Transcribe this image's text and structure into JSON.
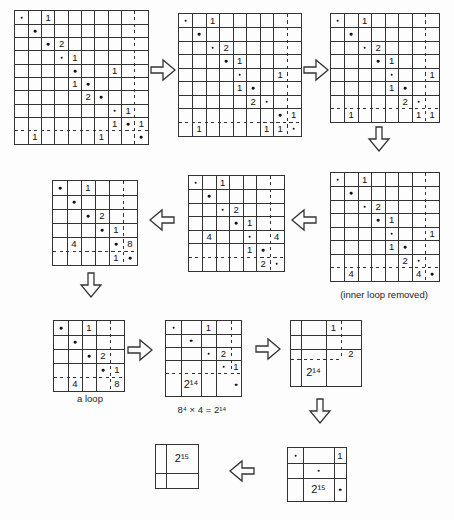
{
  "figure": {
    "bg_color": "#fdfdfd",
    "line_color": "#333333",
    "text_color": "#111111",
    "labels": {
      "inner_loop_removed": "(inner loop removed)",
      "a_loop": "a loop",
      "equation": "8⁴ × 4 = 2¹⁴"
    },
    "grids": [
      {
        "id": "step1-10x10",
        "x": 14,
        "y": 10,
        "ncols": 10,
        "nrows": 10,
        "cell": 13.3,
        "dash_after_col": 9,
        "dash_after_row": 9,
        "dash_v_span": "full",
        "dash_h_span": "full",
        "entries": [
          {
            "r": 1,
            "c": 1,
            "t": "dot"
          },
          {
            "r": 1,
            "c": 3,
            "t": "1"
          },
          {
            "r": 2,
            "c": 2,
            "t": "dot"
          },
          {
            "r": 3,
            "c": 3,
            "t": "dot"
          },
          {
            "r": 3,
            "c": 4,
            "t": "2"
          },
          {
            "r": 4,
            "c": 4,
            "t": "dot"
          },
          {
            "r": 4,
            "c": 5,
            "t": "1"
          },
          {
            "r": 5,
            "c": 5,
            "t": "dot"
          },
          {
            "r": 5,
            "c": 8,
            "t": "1"
          },
          {
            "r": 6,
            "c": 5,
            "t": "1"
          },
          {
            "r": 6,
            "c": 6,
            "t": "dot"
          },
          {
            "r": 7,
            "c": 6,
            "t": "2"
          },
          {
            "r": 7,
            "c": 7,
            "t": "dot"
          },
          {
            "r": 8,
            "c": 8,
            "t": "dot"
          },
          {
            "r": 8,
            "c": 9,
            "t": "1"
          },
          {
            "r": 9,
            "c": 8,
            "t": "1"
          },
          {
            "r": 9,
            "c": 9,
            "t": "dot"
          },
          {
            "r": 9,
            "c": 10,
            "t": "1"
          },
          {
            "r": 10,
            "c": 2,
            "t": "1"
          },
          {
            "r": 10,
            "c": 7,
            "t": "1"
          },
          {
            "r": 10,
            "c": 10,
            "t": "dot"
          }
        ]
      },
      {
        "id": "step2-9x9",
        "x": 178,
        "y": 13,
        "ncols": 9,
        "nrows": 9,
        "cell": 13.5,
        "dash_after_col": 8,
        "dash_after_row": 8,
        "dash_v_span": "full",
        "dash_h_span": "full",
        "entries": [
          {
            "r": 1,
            "c": 1,
            "t": "dot"
          },
          {
            "r": 1,
            "c": 3,
            "t": "1"
          },
          {
            "r": 2,
            "c": 2,
            "t": "dot"
          },
          {
            "r": 3,
            "c": 3,
            "t": "dot"
          },
          {
            "r": 3,
            "c": 4,
            "t": "2"
          },
          {
            "r": 4,
            "c": 4,
            "t": "dot"
          },
          {
            "r": 4,
            "c": 5,
            "t": "1"
          },
          {
            "r": 5,
            "c": 5,
            "t": "dot"
          },
          {
            "r": 5,
            "c": 8,
            "t": "1"
          },
          {
            "r": 6,
            "c": 5,
            "t": "1"
          },
          {
            "r": 6,
            "c": 6,
            "t": "dot"
          },
          {
            "r": 7,
            "c": 6,
            "t": "2"
          },
          {
            "r": 7,
            "c": 7,
            "t": "dot"
          },
          {
            "r": 8,
            "c": 8,
            "t": "dot"
          },
          {
            "r": 8,
            "c": 9,
            "t": "1"
          },
          {
            "r": 9,
            "c": 2,
            "t": "1"
          },
          {
            "r": 9,
            "c": 7,
            "t": "1"
          },
          {
            "r": 9,
            "c": 8,
            "t": "1"
          },
          {
            "r": 9,
            "c": 9,
            "t": "dot"
          }
        ]
      },
      {
        "id": "step3-8x8",
        "x": 330,
        "y": 13,
        "ncols": 8,
        "nrows": 8,
        "cell": 13.5,
        "dash_after_col": 7,
        "dash_after_row": 7,
        "dash_v_span": "full",
        "dash_h_span": "full",
        "entries": [
          {
            "r": 1,
            "c": 1,
            "t": "dot"
          },
          {
            "r": 1,
            "c": 3,
            "t": "1"
          },
          {
            "r": 2,
            "c": 2,
            "t": "dot"
          },
          {
            "r": 3,
            "c": 3,
            "t": "dot"
          },
          {
            "r": 3,
            "c": 4,
            "t": "2"
          },
          {
            "r": 4,
            "c": 4,
            "t": "dot"
          },
          {
            "r": 4,
            "c": 5,
            "t": "1"
          },
          {
            "r": 5,
            "c": 5,
            "t": "dot"
          },
          {
            "r": 5,
            "c": 8,
            "t": "1"
          },
          {
            "r": 6,
            "c": 5,
            "t": "1"
          },
          {
            "r": 6,
            "c": 6,
            "t": "dot"
          },
          {
            "r": 7,
            "c": 6,
            "t": "2"
          },
          {
            "r": 7,
            "c": 7,
            "t": "dot"
          },
          {
            "r": 8,
            "c": 2,
            "t": "1"
          },
          {
            "r": 8,
            "c": 7,
            "t": "1"
          },
          {
            "r": 8,
            "c": 8,
            "t": "1"
          }
        ]
      },
      {
        "id": "step4-8x8-inner-loop-removed",
        "x": 330,
        "y": 172,
        "ncols": 8,
        "nrows": 8,
        "cell": 13.5,
        "dash_after_col": 7,
        "dash_after_row": 7,
        "dash_v_span": "full",
        "dash_h_span": "full",
        "entries": [
          {
            "r": 1,
            "c": 1,
            "t": "dot"
          },
          {
            "r": 1,
            "c": 3,
            "t": "1"
          },
          {
            "r": 2,
            "c": 2,
            "t": "dot"
          },
          {
            "r": 3,
            "c": 3,
            "t": "dot"
          },
          {
            "r": 3,
            "c": 4,
            "t": "2"
          },
          {
            "r": 4,
            "c": 4,
            "t": "dot"
          },
          {
            "r": 4,
            "c": 5,
            "t": "1"
          },
          {
            "r": 5,
            "c": 5,
            "t": "dot"
          },
          {
            "r": 5,
            "c": 8,
            "t": "1"
          },
          {
            "r": 6,
            "c": 5,
            "t": "1"
          },
          {
            "r": 6,
            "c": 6,
            "t": "dot"
          },
          {
            "r": 7,
            "c": 6,
            "t": "2"
          },
          {
            "r": 7,
            "c": 7,
            "t": "dot"
          },
          {
            "r": 8,
            "c": 2,
            "t": "4"
          },
          {
            "r": 8,
            "c": 7,
            "t": "4"
          },
          {
            "r": 8,
            "c": 8,
            "t": "dot"
          }
        ]
      },
      {
        "id": "step5-7x7",
        "x": 188,
        "y": 175,
        "ncols": 7,
        "nrows": 7,
        "cell": 13.5,
        "dash_after_col": 6,
        "dash_after_row": 6,
        "dash_v_span": "full",
        "dash_h_span": "full",
        "entries": [
          {
            "r": 1,
            "c": 1,
            "t": "dot"
          },
          {
            "r": 1,
            "c": 3,
            "t": "1"
          },
          {
            "r": 2,
            "c": 2,
            "t": "dot"
          },
          {
            "r": 3,
            "c": 3,
            "t": "dot"
          },
          {
            "r": 3,
            "c": 4,
            "t": "2"
          },
          {
            "r": 4,
            "c": 4,
            "t": "dot"
          },
          {
            "r": 4,
            "c": 5,
            "t": "1"
          },
          {
            "r": 5,
            "c": 2,
            "t": "4"
          },
          {
            "r": 5,
            "c": 5,
            "t": "dot"
          },
          {
            "r": 5,
            "c": 7,
            "t": "4"
          },
          {
            "r": 6,
            "c": 5,
            "t": "1"
          },
          {
            "r": 6,
            "c": 6,
            "t": "dot"
          },
          {
            "r": 7,
            "c": 6,
            "t": "2"
          },
          {
            "r": 7,
            "c": 7,
            "t": "dot"
          }
        ]
      },
      {
        "id": "step6-6x6",
        "x": 52,
        "y": 180,
        "ncols": 6,
        "nrows": 6,
        "cell": 14,
        "dash_after_col": 5,
        "dash_after_row": 5,
        "dash_v_span": "full",
        "dash_h_span": "full",
        "entries": [
          {
            "r": 1,
            "c": 1,
            "t": "dot"
          },
          {
            "r": 1,
            "c": 3,
            "t": "1"
          },
          {
            "r": 2,
            "c": 2,
            "t": "dot"
          },
          {
            "r": 3,
            "c": 3,
            "t": "dot"
          },
          {
            "r": 3,
            "c": 4,
            "t": "2"
          },
          {
            "r": 4,
            "c": 4,
            "t": "dot"
          },
          {
            "r": 4,
            "c": 5,
            "t": "1"
          },
          {
            "r": 5,
            "c": 2,
            "t": "4"
          },
          {
            "r": 5,
            "c": 5,
            "t": "dot"
          },
          {
            "r": 5,
            "c": 6,
            "t": "8"
          },
          {
            "r": 6,
            "c": 5,
            "t": "1"
          },
          {
            "r": 6,
            "c": 6,
            "t": "dot"
          }
        ]
      },
      {
        "id": "step7-5x5-a-loop",
        "x": 53,
        "y": 320,
        "ncols": 5,
        "nrows": 5,
        "cell": 14,
        "dash_after_col": 4,
        "dash_after_row": 4,
        "dash_v_span": "full",
        "dash_h_span": "full",
        "entries": [
          {
            "r": 1,
            "c": 1,
            "t": "dot"
          },
          {
            "r": 1,
            "c": 3,
            "t": "1"
          },
          {
            "r": 2,
            "c": 2,
            "t": "dot"
          },
          {
            "r": 3,
            "c": 3,
            "t": "dot"
          },
          {
            "r": 3,
            "c": 4,
            "t": "2"
          },
          {
            "r": 4,
            "c": 4,
            "t": "dot"
          },
          {
            "r": 4,
            "c": 5,
            "t": "1"
          },
          {
            "r": 5,
            "c": 2,
            "t": "4"
          },
          {
            "r": 5,
            "c": 5,
            "t": "8"
          }
        ]
      },
      {
        "id": "step8-5x5-condensed",
        "x": 165,
        "y": 320,
        "col_widths": [
          15,
          20,
          15,
          15,
          10
        ],
        "row_heights": [
          13,
          13,
          13,
          13,
          23
        ],
        "dash_after_col": 4,
        "dash_after_row": 4,
        "dash_v_span": "partial",
        "dash_h_span": "full",
        "entries": [
          {
            "r": 1,
            "c": 1,
            "t": "dot"
          },
          {
            "r": 1,
            "c": 3,
            "t": "1"
          },
          {
            "r": 2,
            "c": 2,
            "t": "dot"
          },
          {
            "r": 3,
            "c": 3,
            "t": "dot"
          },
          {
            "r": 3,
            "c": 4,
            "t": "2"
          },
          {
            "r": 4,
            "c": 4,
            "t": "dot"
          },
          {
            "r": 4,
            "c": 5,
            "t": "1"
          },
          {
            "r": 5,
            "c": 2,
            "t": "2¹⁴"
          },
          {
            "r": 5,
            "c": 5,
            "t": "dot"
          }
        ]
      },
      {
        "id": "step9-4x4",
        "x": 290,
        "y": 320,
        "col_widths": [
          10,
          25,
          15,
          20
        ],
        "row_heights": [
          14,
          14,
          10,
          27
        ],
        "dash_after_col": 3,
        "dash_after_row": 3,
        "dash_v_span": "partial",
        "dash_h_span": "partial",
        "entries": [
          {
            "r": 1,
            "c": 3,
            "t": "1"
          },
          {
            "r": 3,
            "c": 4,
            "t": "2"
          },
          {
            "r": 4,
            "c": 2,
            "t": "2¹⁴"
          }
        ]
      },
      {
        "id": "step10-3x3",
        "x": 287,
        "y": 447,
        "col_widths": [
          15,
          31,
          12
        ],
        "row_heights": [
          15,
          15,
          23
        ],
        "dash_after_col": null,
        "dash_after_row": null,
        "dash_v_span": "full",
        "dash_h_span": "full",
        "entries": [
          {
            "r": 1,
            "c": 1,
            "t": "dot"
          },
          {
            "r": 1,
            "c": 3,
            "t": "1"
          },
          {
            "r": 2,
            "c": 2,
            "t": "dot"
          },
          {
            "r": 3,
            "c": 2,
            "t": "2¹⁵"
          },
          {
            "r": 3,
            "c": 3,
            "t": "dot"
          }
        ]
      },
      {
        "id": "step11-2x2",
        "x": 155,
        "y": 444,
        "col_widths": [
          10,
          32
        ],
        "row_heights": [
          28,
          15
        ],
        "dash_after_col": null,
        "dash_after_row": null,
        "dash_v_span": "full",
        "dash_h_span": "full",
        "entries": [
          {
            "r": 1,
            "c": 2,
            "t": "2¹⁵"
          }
        ]
      }
    ],
    "arrows": [
      {
        "dir": "right",
        "x": 150,
        "y": 57
      },
      {
        "dir": "right",
        "x": 303,
        "y": 57
      },
      {
        "dir": "down",
        "x": 366,
        "y": 126
      },
      {
        "dir": "left",
        "x": 291,
        "y": 207
      },
      {
        "dir": "left",
        "x": 149,
        "y": 207
      },
      {
        "dir": "down",
        "x": 78,
        "y": 272
      },
      {
        "dir": "right",
        "x": 127,
        "y": 337
      },
      {
        "dir": "right",
        "x": 255,
        "y": 336
      },
      {
        "dir": "down",
        "x": 307,
        "y": 398
      },
      {
        "dir": "left",
        "x": 229,
        "y": 458
      }
    ]
  }
}
